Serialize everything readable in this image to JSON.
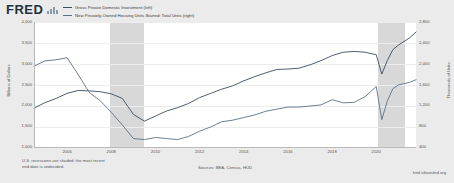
{
  "header": {
    "logo_text": "FRED",
    "logo_mark": "bar-graph-icon"
  },
  "legend": {
    "items": [
      {
        "label": "Gross Private Domestic Investment (left)",
        "color": "#3b4d5e"
      },
      {
        "label": "New Privately-Owned Housing Units Started: Total Units (right)",
        "color": "#5d7285"
      }
    ]
  },
  "axes": {
    "left_title": "Billions of Dollars",
    "right_title": "Thousands of Units",
    "left_ticks": [
      "4,000",
      "3,500",
      "3,000",
      "2,500",
      "2,000",
      "1,500",
      "1,000"
    ],
    "right_ticks": [
      "2,800",
      "2,400",
      "2,000",
      "1,600",
      "1,200",
      "800",
      "400"
    ],
    "x_ticks": [
      "2006",
      "2008",
      "2010",
      "2012",
      "2014",
      "2016",
      "2018",
      "2020"
    ]
  },
  "footer": {
    "note_line1": "U.S. recessions are shaded; the most recent",
    "note_line2": "end date is undecided.",
    "sources": "Sources: BEA, Census, HUD",
    "site": "fred.stlouisfed.org"
  },
  "chart_data": {
    "type": "line",
    "title": "",
    "xlabel": "",
    "ylabel": "Billions of Dollars",
    "y2label": "Thousands of Units",
    "xlim": [
      2004.5,
      2021.8
    ],
    "ylim": [
      1000,
      4000
    ],
    "y2lim": [
      400,
      2800
    ],
    "grid": true,
    "legend_position": "top",
    "recessions": [
      {
        "start": 2007.92,
        "end": 2009.5
      },
      {
        "start": 2020.08,
        "end": 2021.3
      }
    ],
    "series": [
      {
        "name": "Gross Private Domestic Investment (left)",
        "axis": "left",
        "units": "Billions of Dollars",
        "color": "#3b4d5e",
        "x": [
          2004.5,
          2005.0,
          2005.5,
          2006.0,
          2006.5,
          2007.0,
          2007.5,
          2008.0,
          2008.5,
          2009.0,
          2009.5,
          2010.0,
          2010.5,
          2011.0,
          2011.5,
          2012.0,
          2012.5,
          2013.0,
          2013.5,
          2014.0,
          2014.5,
          2015.0,
          2015.5,
          2016.0,
          2016.5,
          2017.0,
          2017.5,
          2018.0,
          2018.5,
          2019.0,
          2019.5,
          2020.0,
          2020.25,
          2020.5,
          2020.75,
          2021.0,
          2021.5,
          2021.8
        ],
        "values": [
          1950,
          2080,
          2180,
          2300,
          2370,
          2360,
          2340,
          2290,
          2180,
          1800,
          1640,
          1760,
          1880,
          1960,
          2060,
          2200,
          2300,
          2400,
          2480,
          2600,
          2700,
          2790,
          2870,
          2880,
          2900,
          2980,
          3080,
          3200,
          3280,
          3300,
          3280,
          3220,
          2760,
          3080,
          3340,
          3450,
          3620,
          3760
        ]
      },
      {
        "name": "New Privately-Owned Housing Units Started: Total Units (right)",
        "axis": "right",
        "units": "Thousands of Units",
        "color": "#5d7285",
        "x": [
          2004.5,
          2005.0,
          2005.5,
          2006.0,
          2006.5,
          2007.0,
          2007.5,
          2008.0,
          2008.5,
          2009.0,
          2009.5,
          2010.0,
          2010.5,
          2011.0,
          2011.5,
          2012.0,
          2012.5,
          2013.0,
          2013.5,
          2014.0,
          2014.5,
          2015.0,
          2015.5,
          2016.0,
          2016.5,
          2017.0,
          2017.5,
          2018.0,
          2018.5,
          2019.0,
          2019.5,
          2020.0,
          2020.25,
          2020.5,
          2020.75,
          2021.0,
          2021.5,
          2021.8
        ],
        "values": [
          1960,
          2060,
          2080,
          2120,
          1800,
          1460,
          1300,
          1080,
          840,
          580,
          560,
          600,
          580,
          560,
          620,
          720,
          800,
          900,
          930,
          980,
          1030,
          1100,
          1140,
          1180,
          1180,
          1200,
          1220,
          1320,
          1260,
          1270,
          1380,
          1570,
          940,
          1290,
          1530,
          1600,
          1650,
          1700
        ]
      }
    ]
  }
}
